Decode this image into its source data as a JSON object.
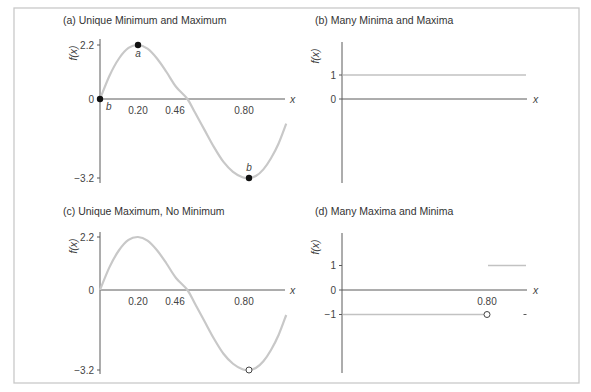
{
  "chart_data": [
    {
      "id": "a",
      "type": "line",
      "title": "(a) Unique Minimum and Maximum",
      "xlabel": "x",
      "ylabel": "f(x)",
      "xlim": [
        0,
        1.0
      ],
      "ylim": [
        -3.2,
        2.2
      ],
      "x_ticks": [
        "0.20",
        "0.46",
        "0.80"
      ],
      "x_tick_values": [
        0.2,
        0.46,
        0.8
      ],
      "y_ticks": [
        "2.2",
        "0",
        "−3.2"
      ],
      "y_tick_values": [
        2.2,
        0,
        -3.2
      ],
      "series": [
        {
          "name": "f(x)",
          "x": [
            0,
            0.05,
            0.1,
            0.15,
            0.2,
            0.25,
            0.3,
            0.35,
            0.4,
            0.46,
            0.5,
            0.55,
            0.6,
            0.65,
            0.7,
            0.75,
            0.78,
            0.82,
            0.86,
            0.9,
            0.94,
            0.98
          ],
          "y": [
            0,
            0.95,
            1.65,
            2.08,
            2.2,
            2.05,
            1.65,
            1.1,
            0.5,
            0,
            -0.55,
            -1.25,
            -1.95,
            -2.55,
            -2.95,
            -3.17,
            -3.2,
            -3.12,
            -2.85,
            -2.4,
            -1.8,
            -1.0
          ]
        }
      ],
      "markers": [
        {
          "x": 0,
          "y": 0,
          "style": "filled",
          "label": "b"
        },
        {
          "x": 0.2,
          "y": 2.2,
          "style": "filled",
          "label": "a"
        },
        {
          "x": 0.78,
          "y": -3.2,
          "style": "filled",
          "label": "b"
        }
      ]
    },
    {
      "id": "b",
      "type": "line",
      "title": "(b) Many Minima and Maxima",
      "xlabel": "x",
      "ylabel": "f(x)",
      "xlim": [
        0,
        1.0
      ],
      "y_ticks": [
        "1",
        "0"
      ],
      "y_tick_values": [
        1,
        0
      ],
      "series": [
        {
          "name": "f(x) = 1",
          "x": [
            0,
            1.0
          ],
          "y": [
            1,
            1
          ]
        }
      ],
      "markers": []
    },
    {
      "id": "c",
      "type": "line",
      "title": "(c) Unique Maximum, No Minimum",
      "xlabel": "x",
      "ylabel": "f(x)",
      "xlim": [
        0,
        1.0
      ],
      "ylim": [
        -3.2,
        2.2
      ],
      "x_ticks": [
        "0.20",
        "0.46",
        "0.80"
      ],
      "x_tick_values": [
        0.2,
        0.46,
        0.8
      ],
      "y_ticks": [
        "2.2",
        "0",
        "−3.2"
      ],
      "y_tick_values": [
        2.2,
        0,
        -3.2
      ],
      "series": [
        {
          "name": "f(x)",
          "x": [
            0,
            0.05,
            0.1,
            0.15,
            0.2,
            0.25,
            0.3,
            0.35,
            0.4,
            0.46,
            0.5,
            0.55,
            0.6,
            0.65,
            0.7,
            0.75,
            0.78,
            0.82,
            0.86,
            0.9,
            0.94,
            0.98
          ],
          "y": [
            0,
            0.95,
            1.65,
            2.08,
            2.2,
            2.05,
            1.65,
            1.1,
            0.5,
            0,
            -0.55,
            -1.25,
            -1.95,
            -2.55,
            -2.95,
            -3.17,
            -3.2,
            -3.12,
            -2.85,
            -2.4,
            -1.8,
            -1.0
          ]
        }
      ],
      "markers": [
        {
          "x": 0.78,
          "y": -3.2,
          "style": "open",
          "label": ""
        }
      ]
    },
    {
      "id": "d",
      "type": "line",
      "title": "(d) Many Maxima and Minima",
      "xlabel": "x",
      "ylabel": "f(x)",
      "xlim": [
        0,
        1.0
      ],
      "x_ticks": [
        "0.80"
      ],
      "x_tick_values": [
        0.8
      ],
      "y_ticks": [
        "1",
        "0",
        "−1"
      ],
      "y_tick_values": [
        1,
        0,
        -1
      ],
      "series": [
        {
          "name": "f(x) = -1 for x < 0.80",
          "x": [
            0,
            0.8
          ],
          "y": [
            -1,
            -1
          ]
        },
        {
          "name": "f(x) = 1 for x > 0.80",
          "x": [
            0.8,
            1.0
          ],
          "y": [
            1,
            1
          ]
        }
      ],
      "markers": [
        {
          "x": 0.8,
          "y": -1,
          "style": "open",
          "label": ""
        },
        {
          "x": 1.0,
          "y": -1,
          "style": "dash",
          "label": ""
        }
      ]
    }
  ]
}
